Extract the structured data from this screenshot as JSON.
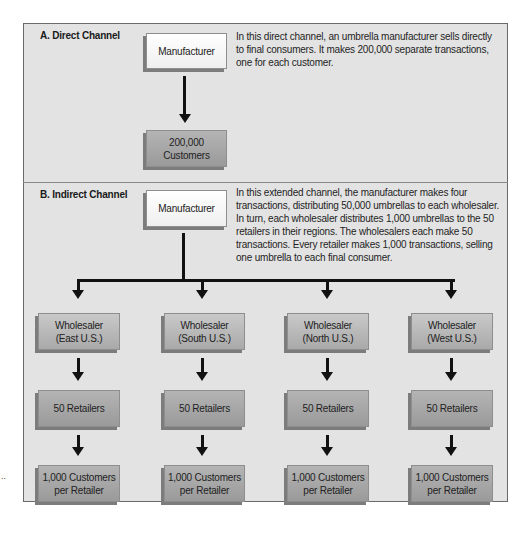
{
  "direct": {
    "title": "A. Direct Channel",
    "manufacturer": "Manufacturer",
    "customers": "200,000\nCustomers",
    "description": "In this direct channel, an umbrella manufacturer sells directly to final consumers. It makes 200,000 separate transactions, one for each customer."
  },
  "indirect": {
    "title": "B. Indirect Channel",
    "manufacturer": "Manufacturer",
    "description": "In this extended channel, the manufacturer makes four transactions, distributing 50,000 umbrellas to each wholesaler. In turn, each wholesaler distributes 1,000 umbrellas to the 50 retailers in their regions. The wholesalers each make 50 transactions. Every retailer makes 1,000 transactions, selling one umbrella to each final consumer.",
    "branches": [
      {
        "wholesaler": "Wholesaler\n(East U.S.)",
        "retailers": "50 Retailers",
        "customers": "1,000 Customers\nper Retailer"
      },
      {
        "wholesaler": "Wholesaler\n(South U.S.)",
        "retailers": "50 Retailers",
        "customers": "1,000 Customers\nper Retailer"
      },
      {
        "wholesaler": "Wholesaler\n(North U.S.)",
        "retailers": "50 Retailers",
        "customers": "1,000 Customers\nper Retailer"
      },
      {
        "wholesaler": "Wholesaler\n(West U.S.)",
        "retailers": "50 Retailers",
        "customers": "1,000 Customers\nper Retailer"
      }
    ]
  },
  "margin_mark": ".."
}
